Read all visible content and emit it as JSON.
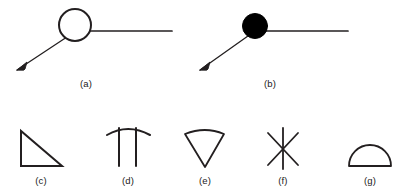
{
  "figure": {
    "background_color": "#ffffff",
    "stroke_color": "#231f20",
    "fill_color": "#000000",
    "panels": [
      {
        "id": "a",
        "caption": "(a)",
        "description": "open circle node with horizontal ray and diagonal arrow",
        "marker": "hollow-circle"
      },
      {
        "id": "b",
        "caption": "(b)",
        "description": "filled circle node with horizontal ray and diagonal arrow",
        "marker": "filled-circle"
      },
      {
        "id": "c",
        "caption": "(c)",
        "description": "right triangle outline",
        "marker": "triangle"
      },
      {
        "id": "d",
        "caption": "(d)",
        "description": "arch with two vertical legs",
        "marker": "arch"
      },
      {
        "id": "e",
        "caption": "(e)",
        "description": "wedge with curved top",
        "marker": "wedge"
      },
      {
        "id": "f",
        "caption": "(f)",
        "description": "six pointed asterisk of crossing lines",
        "marker": "asterisk"
      },
      {
        "id": "g",
        "caption": "(g)",
        "description": "semicircular dome on flat base",
        "marker": "dome"
      }
    ]
  }
}
